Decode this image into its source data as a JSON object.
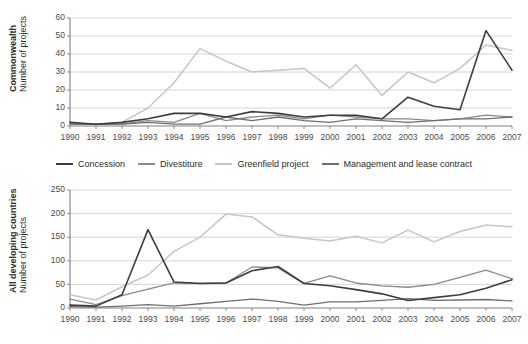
{
  "chart_data": [
    {
      "type": "line",
      "id": "commonwealth",
      "title": "",
      "ylabel_bold": "Commonwealth",
      "ylabel_regular": "Number of projects",
      "xlabel": "",
      "ylim": [
        0,
        60
      ],
      "yticks": [
        0,
        10,
        20,
        30,
        40,
        50,
        60
      ],
      "grid": true,
      "legend_position": "below",
      "x": [
        "1990",
        "1991",
        "1992",
        "1993",
        "1994",
        "1995",
        "1996",
        "1997",
        "1998",
        "1999",
        "2000",
        "2001",
        "2002",
        "2003",
        "2004",
        "2005",
        "2006",
        "2007"
      ],
      "series": [
        {
          "name": "Concession",
          "color": "#3d3d3d",
          "width": 1.6,
          "values": [
            2,
            1,
            2,
            4,
            7,
            7,
            5,
            8,
            7,
            5,
            6,
            6,
            4,
            16,
            11,
            9,
            53,
            31
          ]
        },
        {
          "name": "Divestiture",
          "color": "#8a8a8a",
          "width": 1.3,
          "values": [
            1,
            1,
            1,
            3,
            2,
            7,
            3,
            5,
            6,
            4,
            6,
            5,
            4,
            4,
            3,
            4,
            6,
            5
          ]
        },
        {
          "name": "Greenfield project",
          "color": "#c6c6c6",
          "width": 1.5,
          "values": [
            1,
            1,
            2,
            10,
            24,
            43,
            36,
            30,
            31,
            32,
            21,
            34,
            17,
            30,
            24,
            32,
            45,
            42
          ]
        },
        {
          "name": "Management and lease contract",
          "color": "#6f6f6f",
          "width": 1.3,
          "values": [
            1,
            1,
            1,
            2,
            1,
            1,
            5,
            3,
            5,
            3,
            2,
            4,
            3,
            2,
            3,
            4,
            4,
            5
          ]
        }
      ]
    },
    {
      "type": "line",
      "id": "all-developing-countries",
      "title": "",
      "ylabel_bold": "All developing countries",
      "ylabel_regular": "Number of projects",
      "xlabel": "",
      "ylim": [
        0,
        250
      ],
      "yticks": [
        0,
        50,
        100,
        150,
        200,
        250
      ],
      "grid": true,
      "legend_position": "shared-above",
      "x": [
        "1990",
        "1991",
        "1992",
        "1993",
        "1994",
        "1995",
        "1996",
        "1997",
        "1998",
        "1999",
        "2000",
        "2001",
        "2002",
        "2003",
        "2004",
        "2005",
        "2006",
        "2007"
      ],
      "series": [
        {
          "name": "Concession",
          "color": "#3d3d3d",
          "width": 1.6,
          "values": [
            6,
            4,
            28,
            166,
            55,
            52,
            53,
            79,
            88,
            52,
            47,
            39,
            30,
            16,
            22,
            28,
            42,
            60
          ]
        },
        {
          "name": "Divestiture",
          "color": "#8a8a8a",
          "width": 1.3,
          "values": [
            19,
            7,
            26,
            40,
            53,
            52,
            53,
            87,
            85,
            52,
            68,
            53,
            47,
            44,
            50,
            65,
            80,
            62
          ]
        },
        {
          "name": "Greenfield project",
          "color": "#c6c6c6",
          "width": 1.5,
          "values": [
            28,
            17,
            45,
            70,
            120,
            150,
            199,
            193,
            155,
            148,
            142,
            152,
            138,
            165,
            140,
            162,
            176,
            172
          ]
        },
        {
          "name": "Management and lease contract",
          "color": "#6f6f6f",
          "width": 1.3,
          "values": [
            3,
            2,
            4,
            7,
            4,
            9,
            14,
            19,
            14,
            6,
            13,
            13,
            16,
            20,
            16,
            17,
            18,
            15
          ]
        }
      ]
    }
  ],
  "legend": {
    "items": [
      {
        "label": "Concession",
        "color": "#3d3d3d"
      },
      {
        "label": "Divestiture",
        "color": "#8a8a8a"
      },
      {
        "label": "Greenfield project",
        "color": "#c6c6c6"
      },
      {
        "label": "Management and lease contract",
        "color": "#6f6f6f"
      }
    ]
  }
}
